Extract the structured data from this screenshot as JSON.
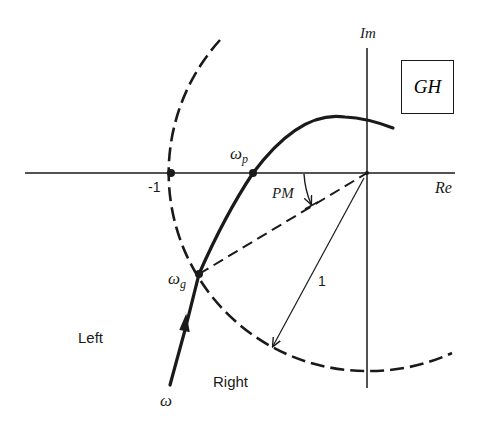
{
  "diagram": {
    "title_box": "GH",
    "axes": {
      "imag_label": "Im",
      "real_label": "Re"
    },
    "points": {
      "minus_one": "-1",
      "phase_crossover": "ω",
      "phase_crossover_sub": "p",
      "gain_crossover": "ω",
      "gain_crossover_sub": "g"
    },
    "annotations": {
      "phase_margin": "PM",
      "unit_radius": "1",
      "region_left": "Left",
      "region_right": "Right",
      "frequency": "ω"
    },
    "colors": {
      "ink": "#1a1a1a",
      "background": "#ffffff"
    }
  }
}
